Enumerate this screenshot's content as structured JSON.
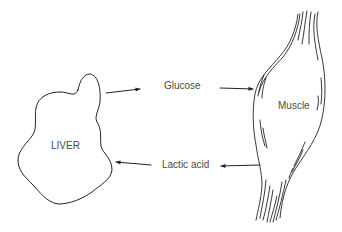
{
  "diagram": {
    "type": "cycle",
    "nodes": [
      {
        "id": "liver",
        "label": "LIVER"
      },
      {
        "id": "muscle",
        "label": "Muscle"
      }
    ],
    "edges": [
      {
        "from": "liver",
        "to": "muscle",
        "label": "Glucose"
      },
      {
        "from": "muscle",
        "to": "liver",
        "label": "Lactic acid"
      }
    ]
  },
  "labels": {
    "liver": "LIVER",
    "muscle": "Muscle",
    "glucose": "Glucose",
    "lactic_acid": "Lactic acid"
  },
  "colors": {
    "stroke": "#222222",
    "text": "#4a4a4a",
    "background": "#ffffff"
  }
}
